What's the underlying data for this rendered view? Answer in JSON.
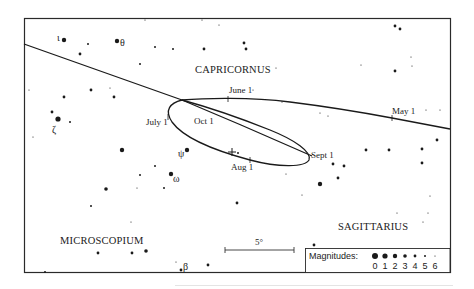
{
  "chart_data": {
    "type": "star_chart",
    "frame": {
      "x": 24,
      "y": 18,
      "w": 426,
      "h": 254
    },
    "constellations": [
      {
        "name": "CAPRICORNUS",
        "x": 227,
        "y": 73
      },
      {
        "name": "MICROSCOPIUM",
        "x": 60,
        "y": 244
      },
      {
        "name": "SAGITTARIUS",
        "x": 338,
        "y": 230
      }
    ],
    "greek_labels": [
      {
        "text": "ι",
        "x": 58,
        "y": 41
      },
      {
        "text": "θ",
        "x": 120,
        "y": 46
      },
      {
        "text": "ζ",
        "x": 53,
        "y": 133
      },
      {
        "text": "ψ",
        "x": 178,
        "y": 157
      },
      {
        "text": "ω",
        "x": 173,
        "y": 182
      },
      {
        "text": "β",
        "x": 182,
        "y": 271
      }
    ],
    "date_labels": [
      {
        "text": "June 1",
        "x": 229,
        "y": 92
      },
      {
        "text": "May 1",
        "x": 392,
        "y": 114
      },
      {
        "text": "July 1",
        "x": 146,
        "y": 124
      },
      {
        "text": "Oct 1",
        "x": 194,
        "y": 124
      },
      {
        "text": "Sept 1",
        "x": 310,
        "y": 158
      },
      {
        "text": "Aug 1",
        "x": 231,
        "y": 170
      }
    ],
    "path_markers": [
      {
        "x": 228,
        "y": 99
      },
      {
        "x": 392,
        "y": 118
      },
      {
        "x": 168,
        "y": 117
      },
      {
        "x": 250,
        "y": 160
      }
    ],
    "current_position_marker": {
      "x": 232,
      "y": 152
    },
    "stars": [
      {
        "x": 64,
        "y": 40,
        "mag": 2
      },
      {
        "x": 117,
        "y": 41,
        "mag": 2
      },
      {
        "x": 88,
        "y": 44,
        "mag": 5
      },
      {
        "x": 80,
        "y": 54,
        "mag": 4
      },
      {
        "x": 155,
        "y": 47,
        "mag": 5
      },
      {
        "x": 173,
        "y": 49,
        "mag": 5
      },
      {
        "x": 204,
        "y": 49,
        "mag": 4
      },
      {
        "x": 244,
        "y": 43,
        "mag": 4
      },
      {
        "x": 246,
        "y": 49,
        "mag": 4
      },
      {
        "x": 145,
        "y": 20,
        "mag": 6
      },
      {
        "x": 202,
        "y": 20,
        "mag": 6
      },
      {
        "x": 219,
        "y": 25,
        "mag": 6
      },
      {
        "x": 140,
        "y": 64,
        "mag": 5
      },
      {
        "x": 91,
        "y": 90,
        "mag": 4
      },
      {
        "x": 110,
        "y": 88,
        "mag": 6
      },
      {
        "x": 64,
        "y": 97,
        "mag": 4
      },
      {
        "x": 114,
        "y": 97,
        "mag": 4
      },
      {
        "x": 29,
        "y": 90,
        "mag": 6
      },
      {
        "x": 52,
        "y": 112,
        "mag": 4
      },
      {
        "x": 58,
        "y": 119,
        "mag": 1
      },
      {
        "x": 70,
        "y": 122,
        "mag": 5
      },
      {
        "x": 33,
        "y": 137,
        "mag": 6
      },
      {
        "x": 122,
        "y": 150,
        "mag": 2
      },
      {
        "x": 155,
        "y": 166,
        "mag": 5
      },
      {
        "x": 106,
        "y": 189,
        "mag": 3
      },
      {
        "x": 137,
        "y": 188,
        "mag": 6
      },
      {
        "x": 187,
        "y": 150,
        "mag": 2
      },
      {
        "x": 171,
        "y": 174,
        "mag": 2
      },
      {
        "x": 140,
        "y": 175,
        "mag": 5
      },
      {
        "x": 164,
        "y": 188,
        "mag": 5
      },
      {
        "x": 91,
        "y": 206,
        "mag": 5
      },
      {
        "x": 131,
        "y": 222,
        "mag": 6
      },
      {
        "x": 98,
        "y": 253,
        "mag": 4
      },
      {
        "x": 132,
        "y": 253,
        "mag": 4
      },
      {
        "x": 146,
        "y": 251,
        "mag": 3
      },
      {
        "x": 181,
        "y": 270,
        "mag": 4
      },
      {
        "x": 208,
        "y": 265,
        "mag": 4
      },
      {
        "x": 45,
        "y": 272,
        "mag": 5
      },
      {
        "x": 176,
        "y": 262,
        "mag": 6
      },
      {
        "x": 237,
        "y": 203,
        "mag": 4
      },
      {
        "x": 238,
        "y": 153,
        "mag": 5
      },
      {
        "x": 286,
        "y": 174,
        "mag": 6
      },
      {
        "x": 320,
        "y": 184,
        "mag": 2
      },
      {
        "x": 333,
        "y": 164,
        "mag": 4
      },
      {
        "x": 344,
        "y": 166,
        "mag": 4
      },
      {
        "x": 338,
        "y": 178,
        "mag": 4
      },
      {
        "x": 302,
        "y": 195,
        "mag": 6
      },
      {
        "x": 366,
        "y": 150,
        "mag": 4
      },
      {
        "x": 389,
        "y": 150,
        "mag": 4
      },
      {
        "x": 422,
        "y": 149,
        "mag": 4
      },
      {
        "x": 422,
        "y": 163,
        "mag": 4
      },
      {
        "x": 397,
        "y": 213,
        "mag": 6
      },
      {
        "x": 423,
        "y": 222,
        "mag": 6
      },
      {
        "x": 428,
        "y": 213,
        "mag": 6
      },
      {
        "x": 430,
        "y": 196,
        "mag": 6
      },
      {
        "x": 314,
        "y": 245,
        "mag": 4
      },
      {
        "x": 395,
        "y": 71,
        "mag": 4
      },
      {
        "x": 395,
        "y": 26,
        "mag": 4
      },
      {
        "x": 400,
        "y": 29,
        "mag": 4
      },
      {
        "x": 411,
        "y": 57,
        "mag": 6
      },
      {
        "x": 412,
        "y": 66,
        "mag": 6
      },
      {
        "x": 361,
        "y": 65,
        "mag": 6
      },
      {
        "x": 426,
        "y": 110,
        "mag": 6
      },
      {
        "x": 440,
        "y": 110,
        "mag": 6
      },
      {
        "x": 437,
        "y": 140,
        "mag": 4
      },
      {
        "x": 282,
        "y": 102,
        "mag": 6
      },
      {
        "x": 320,
        "y": 113,
        "mag": 6
      },
      {
        "x": 328,
        "y": 116,
        "mag": 6
      },
      {
        "x": 253,
        "y": 90,
        "mag": 6
      },
      {
        "x": 276,
        "y": 68,
        "mag": 6
      }
    ],
    "scale_bar": {
      "label": "5°",
      "x1": 225,
      "x2": 294,
      "y": 250
    },
    "legend": {
      "title": "Magnitudes:",
      "entries": [
        {
          "mag": 0,
          "r": 3.0
        },
        {
          "mag": 1,
          "r": 2.6
        },
        {
          "mag": 2,
          "r": 2.2
        },
        {
          "mag": 3,
          "r": 1.8
        },
        {
          "mag": 4,
          "r": 1.4
        },
        {
          "mag": 5,
          "r": 1.0
        },
        {
          "mag": 6,
          "r": 0.6
        }
      ]
    },
    "colors": {
      "ink": "#1a1a1a",
      "frame": "#2a2a2a",
      "background": "#ffffff"
    }
  }
}
